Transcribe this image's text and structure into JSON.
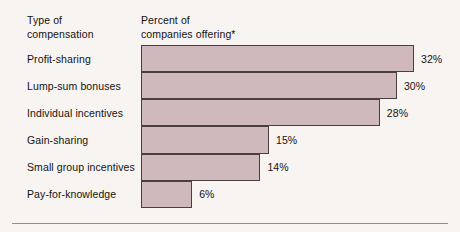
{
  "headings": {
    "category": "Type of\ncompensation",
    "value": "Percent of\ncompanies offering*"
  },
  "chart_data": {
    "type": "bar",
    "orientation": "horizontal",
    "title": "",
    "xlabel": "Percent of companies offering*",
    "ylabel": "Type of compensation",
    "categories": [
      "Profit-sharing",
      "Lump-sum bonuses",
      "Individual incentives",
      "Gain-sharing",
      "Small group incentives",
      "Pay-for-knowledge"
    ],
    "values": [
      32,
      30,
      28,
      15,
      14,
      6
    ],
    "value_labels": [
      "32%",
      "30%",
      "28%",
      "15%",
      "14%",
      "6%"
    ],
    "xlim": [
      0,
      35
    ],
    "grid": false,
    "legend": null,
    "bar_color": "#cfb9bc",
    "bar_border_color": "#4a3f40",
    "background_color": "#f7f4f2",
    "footnote_marker": "*"
  }
}
